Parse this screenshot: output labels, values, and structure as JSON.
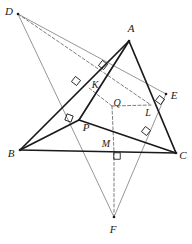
{
  "figure": {
    "type": "geometry-diagram",
    "canvas": {
      "width": 192,
      "height": 244,
      "background": "#ffffff"
    },
    "colors": {
      "heavy_stroke": "#1a1a1a",
      "light_stroke": "#8a8a8a",
      "dashed_stroke": "#6e6e6e",
      "label_text": "#1a1a1a"
    },
    "points": [
      {
        "name": "A",
        "label": "A",
        "x": 129,
        "y": 41,
        "label_x": 131,
        "label_y": 28,
        "kind": "vertex"
      },
      {
        "name": "B",
        "label": "B",
        "x": 20,
        "y": 150,
        "label_x": 11,
        "label_y": 153,
        "kind": "vertex"
      },
      {
        "name": "C",
        "label": "C",
        "x": 176,
        "y": 153,
        "label_x": 183,
        "label_y": 155,
        "kind": "vertex"
      },
      {
        "name": "D",
        "label": "D",
        "x": 18,
        "y": 14,
        "label_x": 9,
        "label_y": 11,
        "kind": "vertex"
      },
      {
        "name": "E",
        "label": "E",
        "x": 166,
        "y": 94,
        "label_x": 174,
        "label_y": 95,
        "kind": "vertex"
      },
      {
        "name": "F",
        "label": "F",
        "x": 114,
        "y": 217,
        "label_x": 113,
        "label_y": 229,
        "kind": "vertex"
      },
      {
        "name": "K",
        "label": "K",
        "x": 89,
        "y": 88,
        "label_x": 95,
        "label_y": 85,
        "kind": "foot"
      },
      {
        "name": "L",
        "label": "L",
        "x": 151,
        "y": 105,
        "label_x": 148,
        "label_y": 113,
        "kind": "foot"
      },
      {
        "name": "P",
        "label": "P",
        "x": 79,
        "y": 120,
        "label_x": 86,
        "label_y": 127,
        "kind": "vertex"
      },
      {
        "name": "Q",
        "label": "Q",
        "x": 112,
        "y": 106,
        "label_x": 117,
        "label_y": 103,
        "kind": "center"
      },
      {
        "name": "M",
        "label": "M",
        "x": 114,
        "y": 152,
        "label_x": 106,
        "label_y": 144,
        "kind": "foot"
      }
    ],
    "segments": [
      {
        "name": "B-C",
        "from": "B",
        "to": "C",
        "style": "heavy"
      },
      {
        "name": "B-A",
        "from": "B",
        "to": "A",
        "style": "heavy"
      },
      {
        "name": "A-C",
        "from": "A",
        "to": "C",
        "style": "heavy"
      },
      {
        "name": "B-P",
        "from": "B",
        "to": "P",
        "style": "heavy"
      },
      {
        "name": "P-C",
        "from": "P",
        "to": "C",
        "style": "heavy"
      },
      {
        "name": "P-A",
        "from": "P",
        "to": "A",
        "style": "heavy"
      },
      {
        "name": "D-E",
        "from": "D",
        "to": "E",
        "style": "light"
      },
      {
        "name": "D-F",
        "from": "D",
        "to": "F",
        "style": "light"
      },
      {
        "name": "E-F",
        "from": "E",
        "to": "F",
        "style": "light"
      },
      {
        "name": "D-L",
        "from": "D",
        "to": "L",
        "style": "dashed"
      },
      {
        "name": "Q-L",
        "from": "Q",
        "to": "L",
        "style": "dashed"
      },
      {
        "name": "Q-K",
        "from": "Q",
        "to": "K",
        "style": "dashed"
      },
      {
        "name": "Q-M",
        "from": "Q",
        "to": "M",
        "style": "dashed"
      },
      {
        "name": "M-F",
        "from": "M",
        "to": "F",
        "style": "dashed"
      }
    ],
    "right_angle_marks": [
      {
        "name": "right-angle-at-K-upper",
        "x": 103,
        "y": 65,
        "rotation": 38
      },
      {
        "name": "right-angle-at-K",
        "x": 76,
        "y": 81,
        "rotation": 38
      },
      {
        "name": "right-angle-at-P",
        "x": 69,
        "y": 118,
        "rotation": 20
      },
      {
        "name": "right-angle-at-E",
        "x": 160,
        "y": 100,
        "rotation": -52
      },
      {
        "name": "right-angle-at-L",
        "x": 146,
        "y": 131,
        "rotation": -52
      },
      {
        "name": "right-angle-at-M",
        "x": 117,
        "y": 156,
        "rotation": 0
      }
    ],
    "notes": {
      "heavy_shape": "Triangle ABC with inner triangle BPC and cevian PA",
      "light_shape": "Triangle DEF overlapping",
      "dashed_shape": "Perpendicular feet K, L, M from center Q"
    }
  }
}
